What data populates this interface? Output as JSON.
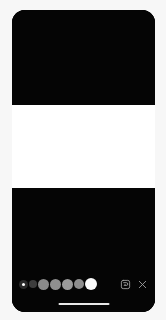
{
  "app": {
    "name": "camera-filter-editor",
    "frame_background": "#050505",
    "page_background": "#f7f7f7"
  },
  "canvas": {
    "name": "photo-preview",
    "bands": [
      {
        "id": "band-top",
        "color": "#050505",
        "label": "dark band top"
      },
      {
        "id": "band-white",
        "color": "#ffffff",
        "label": "white band middle"
      },
      {
        "id": "band-bottom",
        "color": "#050505",
        "label": "dark band bottom"
      }
    ]
  },
  "toolbar": {
    "name": "bottom-toolbar",
    "swatches": [
      {
        "index": 1,
        "color": "#2a2a2a",
        "size": 9,
        "selected": true,
        "label": "shade-1"
      },
      {
        "index": 2,
        "color": "#3d3d3d",
        "size": 8,
        "selected": false,
        "label": "shade-2"
      },
      {
        "index": 3,
        "color": "#8a8a8a",
        "size": 11,
        "selected": false,
        "label": "shade-3"
      },
      {
        "index": 4,
        "color": "#8f8f8f",
        "size": 11,
        "selected": false,
        "label": "shade-4"
      },
      {
        "index": 5,
        "color": "#9a9a9a",
        "size": 11,
        "selected": false,
        "label": "shade-5"
      },
      {
        "index": 6,
        "color": "#8d8d8d",
        "size": 10,
        "selected": false,
        "label": "shade-6"
      },
      {
        "index": 7,
        "color": "#fafafa",
        "size": 12,
        "selected": false,
        "label": "shade-7"
      }
    ],
    "actions": [
      {
        "id": "save",
        "icon": "save-icon",
        "label": "Save"
      },
      {
        "id": "close",
        "icon": "close-icon",
        "label": "Close"
      }
    ]
  },
  "system": {
    "home_indicator": {
      "name": "home-indicator",
      "color": "#e8e8e8"
    }
  }
}
